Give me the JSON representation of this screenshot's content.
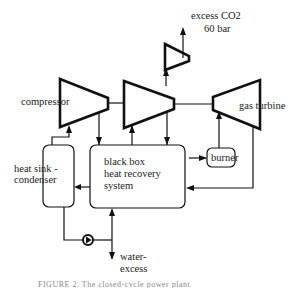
{
  "diagram": {
    "type": "process-flow",
    "nodes": {
      "compressor": {
        "label": "compressor"
      },
      "co2_turbine": {
        "label": ""
      },
      "co2_compressor": {
        "label": ""
      },
      "gas_turbine": {
        "label": "gas turbine"
      },
      "heat_sink": {
        "label_line1": "heat sink -",
        "label_line2": "condenser"
      },
      "black_box": {
        "label_line1": "black box",
        "label_line2": "heat recovery",
        "label_line3": "system"
      },
      "burner": {
        "label": "burner"
      },
      "pump": {
        "label": ""
      }
    },
    "outputs": {
      "excess_co2": {
        "line1": "excess CO2",
        "line2": "60 bar"
      },
      "water_excess": {
        "line1": "water-",
        "line2": "excess"
      }
    },
    "caption": "FIGURE 2. The closed-cycle power plant"
  }
}
